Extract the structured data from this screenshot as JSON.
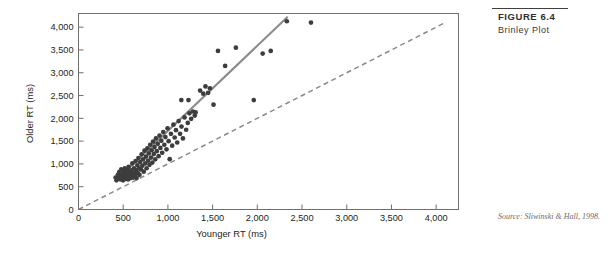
{
  "figure": {
    "number_label": "FIGURE 6.4",
    "title": "Brinley Plot",
    "source_note": "Source: Sliwinski & Hall, 1998."
  },
  "colors": {
    "point": "#3d3d3d",
    "regression_line": "#8a8a8a",
    "identity_line": "#8a8a8a",
    "axis": "#6f6f6f",
    "text": "#231f20",
    "caption_rule": "#3f3f3f"
  },
  "chart_data": {
    "type": "scatter",
    "title": "",
    "xlabel": "Younger RT (ms)",
    "ylabel": "Older RT (ms)",
    "xlim": [
      0,
      4250
    ],
    "ylim": [
      0,
      4300
    ],
    "grid": false,
    "legend": "none",
    "xticks": [
      0,
      500,
      1000,
      1500,
      2000,
      2500,
      3000,
      3500,
      4000
    ],
    "xticklabels": [
      "0",
      "500",
      "1,000",
      "1,500",
      "2,000",
      "2,500",
      "3,000",
      "3,500",
      "4,000"
    ],
    "yticks": [
      0,
      500,
      1000,
      1500,
      2000,
      2500,
      3000,
      3500,
      4000
    ],
    "yticklabels": [
      "0",
      "500",
      "1,000",
      "1,500",
      "2,000",
      "2,500",
      "3,000",
      "3,500",
      "4,000"
    ],
    "series": [
      {
        "name": "Participant mean RTs",
        "marker": "circle",
        "points": [
          [
            415,
            700
          ],
          [
            425,
            640
          ],
          [
            440,
            760
          ],
          [
            450,
            690
          ],
          [
            455,
            820
          ],
          [
            462,
            735
          ],
          [
            470,
            660
          ],
          [
            478,
            880
          ],
          [
            485,
            700
          ],
          [
            492,
            775
          ],
          [
            498,
            640
          ],
          [
            505,
            845
          ],
          [
            512,
            720
          ],
          [
            518,
            905
          ],
          [
            524,
            670
          ],
          [
            530,
            790
          ],
          [
            536,
            700
          ],
          [
            542,
            870
          ],
          [
            548,
            745
          ],
          [
            554,
            660
          ],
          [
            560,
            935
          ],
          [
            566,
            700
          ],
          [
            572,
            815
          ],
          [
            578,
            760
          ],
          [
            584,
            690
          ],
          [
            590,
            860
          ],
          [
            596,
            725
          ],
          [
            602,
            1010
          ],
          [
            608,
            770
          ],
          [
            614,
            700
          ],
          [
            620,
            905
          ],
          [
            626,
            805
          ],
          [
            632,
            745
          ],
          [
            638,
            1060
          ],
          [
            644,
            860
          ],
          [
            650,
            690
          ],
          [
            658,
            970
          ],
          [
            664,
            800
          ],
          [
            670,
            1130
          ],
          [
            676,
            905
          ],
          [
            682,
            760
          ],
          [
            690,
            1040
          ],
          [
            698,
            880
          ],
          [
            706,
            1210
          ],
          [
            714,
            960
          ],
          [
            722,
            1100
          ],
          [
            730,
            830
          ],
          [
            738,
            1290
          ],
          [
            746,
            1010
          ],
          [
            754,
            1160
          ],
          [
            762,
            905
          ],
          [
            770,
            1340
          ],
          [
            778,
            1070
          ],
          [
            786,
            1230
          ],
          [
            794,
            980
          ],
          [
            802,
            1420
          ],
          [
            810,
            1140
          ],
          [
            818,
            1300
          ],
          [
            826,
            1030
          ],
          [
            834,
            1490
          ],
          [
            842,
            1215
          ],
          [
            850,
            1370
          ],
          [
            858,
            1100
          ],
          [
            866,
            1560
          ],
          [
            876,
            1280
          ],
          [
            886,
            1440
          ],
          [
            896,
            1170
          ],
          [
            906,
            1620
          ],
          [
            916,
            1350
          ],
          [
            926,
            1510
          ],
          [
            936,
            1245
          ],
          [
            948,
            1700
          ],
          [
            960,
            1420
          ],
          [
            972,
            1590
          ],
          [
            984,
            1320
          ],
          [
            996,
            1780
          ],
          [
            1008,
            1500
          ],
          [
            1020,
            1105
          ],
          [
            1034,
            1660
          ],
          [
            1048,
            1400
          ],
          [
            1062,
            1860
          ],
          [
            1076,
            1580
          ],
          [
            1090,
            1740
          ],
          [
            1104,
            1470
          ],
          [
            1120,
            1940
          ],
          [
            1136,
            1660
          ],
          [
            1152,
            1820
          ],
          [
            1168,
            1560
          ],
          [
            1186,
            2020
          ],
          [
            1204,
            1750
          ],
          [
            1222,
            1900
          ],
          [
            1240,
            2110
          ],
          [
            1260,
            1990
          ],
          [
            1280,
            2150
          ],
          [
            1300,
            2060
          ],
          [
            1150,
            2400
          ],
          [
            1230,
            2400
          ],
          [
            1310,
            2130
          ],
          [
            1360,
            2610
          ],
          [
            1395,
            2540
          ],
          [
            1420,
            2700
          ],
          [
            1450,
            2560
          ],
          [
            1470,
            2660
          ],
          [
            1510,
            2300
          ],
          [
            1560,
            3480
          ],
          [
            1640,
            3150
          ],
          [
            1760,
            3550
          ],
          [
            1960,
            2400
          ],
          [
            2060,
            3420
          ],
          [
            2150,
            3480
          ],
          [
            2330,
            4130
          ],
          [
            2600,
            4100
          ]
        ]
      }
    ],
    "reference_lines": [
      {
        "name": "regression-line",
        "style": "solid",
        "x0": 420,
        "y0": 640,
        "x1": 2340,
        "y1": 4230
      },
      {
        "name": "identity-line",
        "style": "dashed",
        "x0": 0,
        "y0": 0,
        "x1": 4080,
        "y1": 4080
      }
    ]
  }
}
